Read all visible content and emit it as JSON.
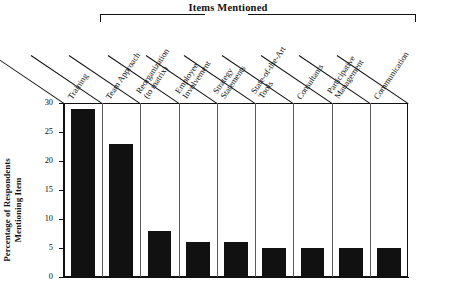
{
  "header": {
    "bracket_title": "Items Mentioned"
  },
  "axis": {
    "y_title_line1": "Percentage of Respondents",
    "y_title_line2": "Mentioning Item",
    "y_ticks": [
      "30",
      "25",
      "20",
      "15",
      "10",
      "5",
      "0"
    ]
  },
  "chart_data": {
    "type": "bar",
    "title": "Items Mentioned",
    "xlabel": "",
    "ylabel": "Percentage of Respondents Mentioning Item",
    "ylim": [
      0,
      30
    ],
    "ytick_values": [
      0,
      5,
      10,
      15,
      20,
      25,
      30
    ],
    "grid": false,
    "legend": "none",
    "orientation": "vertical",
    "bar_color": "#111111",
    "categories": [
      "Training",
      "Team Approach",
      "Reorganization (to matrix)",
      "Employee Involvement",
      "Strategy Statements",
      "State-of-the-Art Tools",
      "Consultants",
      "Participative Management",
      "Communication"
    ],
    "category_lines": [
      [
        "Training"
      ],
      [
        "Team Approach"
      ],
      [
        "Reorganization",
        "(to matrix)"
      ],
      [
        "Employee",
        "Involvement"
      ],
      [
        "Strategy",
        "Statements"
      ],
      [
        "State-of-the-Art",
        "Tools"
      ],
      [
        "Consultants"
      ],
      [
        "Participative",
        "Management"
      ],
      [
        "Communication"
      ]
    ],
    "values": [
      29,
      23,
      8,
      6,
      6,
      5,
      5,
      5,
      5
    ]
  }
}
